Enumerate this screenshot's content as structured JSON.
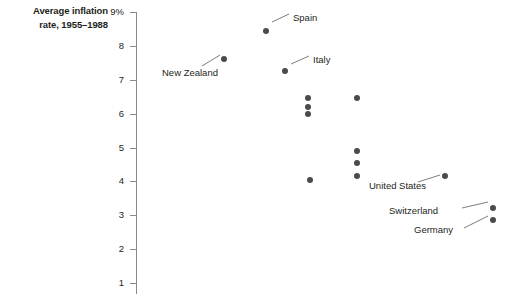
{
  "chart": {
    "title": "Average inflation\nrate, 1955–1988",
    "axis_unit_label": "9%",
    "dot_color": "#4a4a4f",
    "axis_color": "#8b8b8b",
    "text_color": "#231f20"
  },
  "chart_data": {
    "type": "scatter",
    "title": "Average inflation rate, 1955–1988",
    "xlabel": "",
    "ylabel": "Average inflation rate, 1955–1988",
    "ylim": [
      1,
      9
    ],
    "yticks": [
      9,
      8,
      7,
      6,
      5,
      4,
      3,
      2,
      1
    ],
    "ytick_labels": [
      "9%",
      "8",
      "7",
      "6",
      "5",
      "4",
      "3",
      "2",
      "1"
    ],
    "grid": false,
    "legend": "none",
    "x_axis_visible": false,
    "points": [
      {
        "label": "Spain",
        "x": 266,
        "y_value": 8.45,
        "label_x": 293,
        "label_y": 12,
        "leader": [
          272,
          22,
          289,
          14
        ]
      },
      {
        "label": "New Zealand",
        "x": 224,
        "y_value": 7.6,
        "label_x": 162,
        "label_y": 67,
        "leader": [
          220,
          55,
          202,
          66
        ]
      },
      {
        "label": "Italy",
        "x": 285,
        "y_value": 7.25,
        "label_x": 313,
        "label_y": 54,
        "leader": [
          291,
          64,
          309,
          56
        ]
      },
      {
        "label": "",
        "x": 308,
        "y_value": 6.45,
        "label_x": null,
        "label_y": null,
        "leader": null
      },
      {
        "label": "",
        "x": 357,
        "y_value": 6.45,
        "label_x": null,
        "label_y": null,
        "leader": null
      },
      {
        "label": "",
        "x": 308,
        "y_value": 6.2,
        "label_x": null,
        "label_y": null,
        "leader": null
      },
      {
        "label": "",
        "x": 308,
        "y_value": 6.0,
        "label_x": null,
        "label_y": null,
        "leader": null
      },
      {
        "label": "",
        "x": 357,
        "y_value": 4.9,
        "label_x": null,
        "label_y": null,
        "leader": null
      },
      {
        "label": "",
        "x": 357,
        "y_value": 4.55,
        "label_x": null,
        "label_y": null,
        "leader": null
      },
      {
        "label": "",
        "x": 357,
        "y_value": 4.15,
        "label_x": null,
        "label_y": null,
        "leader": null
      },
      {
        "label": "",
        "x": 310,
        "y_value": 4.05,
        "label_x": null,
        "label_y": null,
        "leader": null
      },
      {
        "label": "United States",
        "x": 445,
        "y_value": 4.15,
        "label_x": 369,
        "label_y": 180,
        "leader": [
          440,
          175,
          418,
          182
        ]
      },
      {
        "label": "Switzerland",
        "x": 493,
        "y_value": 3.2,
        "label_x": 389,
        "label_y": 205,
        "leader": [
          488,
          202,
          462,
          208
        ]
      },
      {
        "label": "Germany",
        "x": 493,
        "y_value": 2.85,
        "label_x": 414,
        "label_y": 224,
        "leader": [
          488,
          216,
          464,
          228
        ]
      }
    ]
  }
}
